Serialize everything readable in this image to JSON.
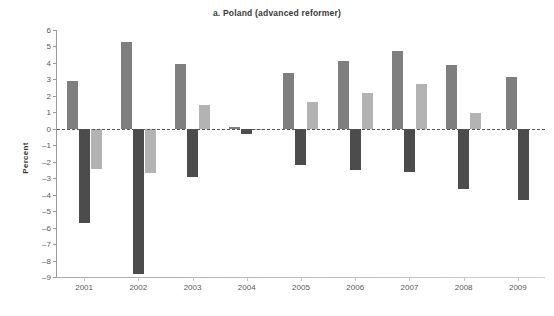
{
  "chart_data": {
    "type": "bar",
    "title": "a. Poland (advanced reformer)",
    "xlabel": "",
    "ylabel": "Percent",
    "categories": [
      "2001",
      "2002",
      "2003",
      "2004",
      "2005",
      "2006",
      "2007",
      "2008",
      "2009"
    ],
    "ylim": [
      -9,
      6
    ],
    "ytick_values": [
      6,
      5,
      4,
      3,
      2,
      1,
      0,
      -1,
      -2,
      -3,
      -4,
      -5,
      -6,
      -7,
      -8,
      -9
    ],
    "ytick_labels": [
      "6",
      "5",
      "4",
      "3",
      "2",
      "1",
      "0",
      "–1",
      "–2",
      "–3",
      "–4",
      "–5",
      "–6",
      "–7",
      "–8",
      "–9"
    ],
    "grid": false,
    "zero_line": true,
    "zero_line_style": "dashed",
    "legend": "none",
    "series": [
      {
        "name": "series-1",
        "color": "#7f7f7f",
        "values": [
          2.9,
          5.25,
          3.95,
          0.1,
          3.4,
          4.1,
          4.75,
          3.9,
          3.15
        ]
      },
      {
        "name": "series-2",
        "color": "#4c4c4c",
        "values": [
          -5.7,
          -8.8,
          -2.9,
          -0.3,
          -2.2,
          -2.5,
          -2.6,
          -3.65,
          -4.35
        ]
      },
      {
        "name": "series-3",
        "color": "#b3b3b3",
        "values": [
          -2.45,
          -2.7,
          1.45,
          -0.05,
          1.6,
          2.2,
          2.7,
          0.95,
          null
        ]
      }
    ]
  }
}
